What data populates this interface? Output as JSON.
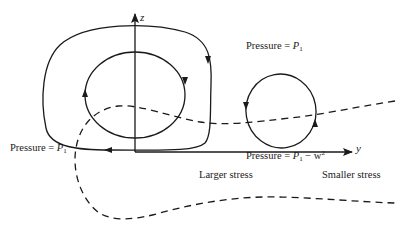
{
  "figure": {
    "axes": {
      "vertical_label": "z",
      "horizontal_label": "y"
    },
    "labels": {
      "pressure_top_right": {
        "prefix": "Pressure = ",
        "var": "P",
        "sub": "1"
      },
      "pressure_left": {
        "prefix": "Pressure = ",
        "var": "P",
        "sub": "1"
      },
      "pressure_bottom_right": {
        "prefix": "Pressure = ",
        "var": "P",
        "sub": "1",
        "suffix": " − w",
        "sup": "2"
      },
      "larger_stress": "Larger stress",
      "smaller_stress": "Smaller stress"
    },
    "elements": [
      {
        "name": "outer-loop",
        "style": "solid",
        "direction": "clockwise"
      },
      {
        "name": "inner-loop",
        "style": "solid",
        "direction": "clockwise"
      },
      {
        "name": "right-loop",
        "style": "solid",
        "direction": "counter-clockwise"
      },
      {
        "name": "interface-curve",
        "style": "dashed"
      }
    ],
    "colors": {
      "ink": "#1a1a1a",
      "background": "#ffffff"
    }
  }
}
